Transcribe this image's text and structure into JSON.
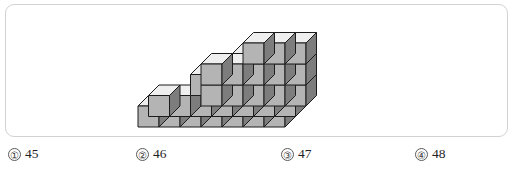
{
  "figure": {
    "name": "isometric-cube-stack",
    "colors": {
      "top_face": "#efefef",
      "left_face": "#b4b4b4",
      "right_face": "#7d7d7d",
      "outline": "#1c1c1c",
      "panel_border": "#d2d2d2",
      "background": "#ffffff"
    },
    "geometry": {
      "cube_width": 21,
      "cube_height": 21,
      "iso_dx": 10.5,
      "iso_dy": -10.5,
      "origin_x": 132,
      "origin_y": 122
    },
    "cubes": [
      {
        "x": 0,
        "y": 0,
        "z": 0
      },
      {
        "x": 1,
        "y": 0,
        "z": 0
      },
      {
        "x": 2,
        "y": 0,
        "z": 0
      },
      {
        "x": 3,
        "y": 0,
        "z": 0
      },
      {
        "x": 4,
        "y": 0,
        "z": 0
      },
      {
        "x": 5,
        "y": 0,
        "z": 0
      },
      {
        "x": 6,
        "y": 0,
        "z": 0
      },
      {
        "x": 0,
        "y": 1,
        "z": 0
      },
      {
        "x": 1,
        "y": 1,
        "z": 0
      },
      {
        "x": 2,
        "y": 1,
        "z": 0
      },
      {
        "x": 3,
        "y": 1,
        "z": 0
      },
      {
        "x": 4,
        "y": 1,
        "z": 0
      },
      {
        "x": 5,
        "y": 1,
        "z": 0
      },
      {
        "x": 6,
        "y": 1,
        "z": 0
      },
      {
        "x": 2,
        "y": 2,
        "z": 0
      },
      {
        "x": 3,
        "y": 2,
        "z": 0
      },
      {
        "x": 4,
        "y": 2,
        "z": 0
      },
      {
        "x": 5,
        "y": 2,
        "z": 0
      },
      {
        "x": 6,
        "y": 2,
        "z": 0
      },
      {
        "x": 2,
        "y": 1,
        "z": 1
      },
      {
        "x": 3,
        "y": 1,
        "z": 1
      },
      {
        "x": 4,
        "y": 1,
        "z": 1
      },
      {
        "x": 5,
        "y": 1,
        "z": 1
      },
      {
        "x": 6,
        "y": 1,
        "z": 1
      },
      {
        "x": 2,
        "y": 2,
        "z": 1
      },
      {
        "x": 3,
        "y": 2,
        "z": 1
      },
      {
        "x": 4,
        "y": 2,
        "z": 1
      },
      {
        "x": 5,
        "y": 2,
        "z": 1
      },
      {
        "x": 6,
        "y": 2,
        "z": 1
      },
      {
        "x": 4,
        "y": 2,
        "z": 2
      },
      {
        "x": 5,
        "y": 2,
        "z": 2
      },
      {
        "x": 6,
        "y": 2,
        "z": 2
      },
      {
        "x": 4,
        "y": 1,
        "z": 2
      },
      {
        "x": 6,
        "y": 1,
        "z": 2
      }
    ]
  },
  "choices": [
    {
      "marker": "①",
      "label": "45"
    },
    {
      "marker": "②",
      "label": "46"
    },
    {
      "marker": "③",
      "label": "47"
    },
    {
      "marker": "④",
      "label": "48"
    }
  ]
}
